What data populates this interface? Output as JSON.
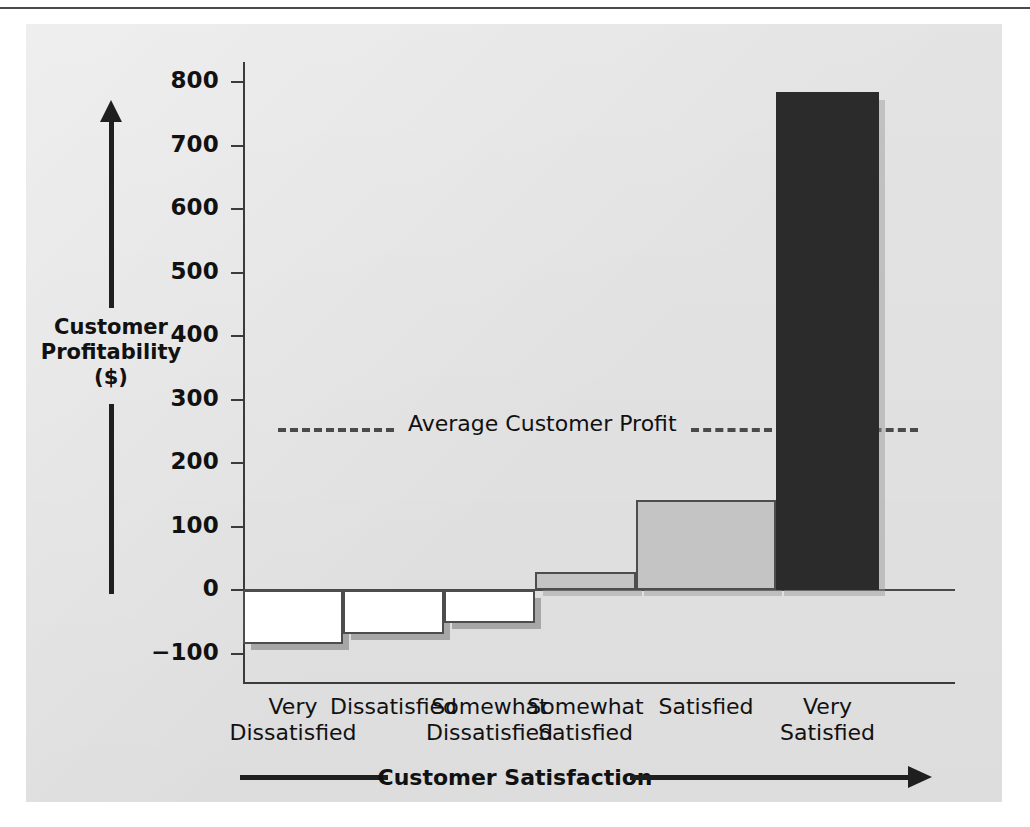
{
  "chart_data": {
    "type": "bar",
    "title": "",
    "categories": [
      "Very\nDissatisfied",
      "Dissatisfied",
      "Somewhat\nDissatisfied",
      "Somewhat\nSatisfied",
      "Satisfied",
      "Very\nSatisfied"
    ],
    "values": [
      -85,
      -70,
      -52,
      28,
      142,
      785
    ],
    "xlabel": "Customer Satisfaction",
    "ylabel": "Customer\nProfitability\n($)",
    "ylim": [
      -100,
      800
    ],
    "yticks": [
      800,
      700,
      600,
      500,
      400,
      300,
      200,
      100,
      0,
      -100
    ],
    "ytick_labels": [
      "800",
      "700",
      "600",
      "500",
      "400",
      "300",
      "200",
      "100",
      "0",
      "−100"
    ],
    "grid": false,
    "legend": "none",
    "annotations": [
      {
        "label": "Average Customer Profit",
        "value": 255,
        "style": "dashed-horizontal-line"
      }
    ],
    "bar_colors": [
      "#ffffff",
      "#ffffff",
      "#ffffff",
      "#c4c4c4",
      "#c4c4c4",
      "#2b2b2b"
    ]
  },
  "axis": {
    "y_title_line1": "Customer",
    "y_title_line2": "Profitability",
    "y_title_line3": "($)",
    "x_title": "Customer Satisfaction"
  },
  "annotation": {
    "average_label": "Average Customer Profit"
  },
  "colors": {
    "panel": "#e7e7e7",
    "bar_negative": "#ffffff",
    "bar_light": "#c4c4c4",
    "bar_dark": "#2b2b2b",
    "axis": "#3b3b3b",
    "text": "#111111"
  }
}
